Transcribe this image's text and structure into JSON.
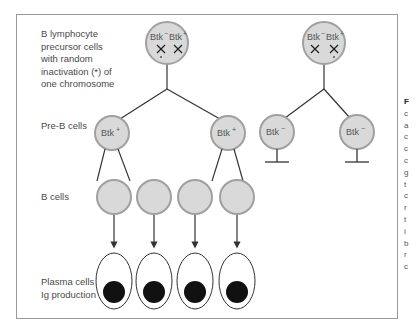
{
  "diagram": {
    "row_labels": {
      "precursor": [
        "B lymphocyte",
        "precursor cells",
        "with random",
        "inactivation (*) of",
        "one chromosome"
      ],
      "pre_b": "Pre-B cells",
      "b_cells": "B cells",
      "plasma": [
        "Plasma cells",
        "Ig production"
      ]
    },
    "left_lineage": {
      "precursor_cell": {
        "alleles": [
          "Btk",
          "Btk"
        ],
        "allele_signs": [
          "−",
          "+"
        ],
        "inactivated_allele_index": 0
      },
      "pre_b_cells": [
        {
          "label": "Btk",
          "sign": "+"
        },
        {
          "label": "Btk",
          "sign": "+"
        }
      ],
      "b_cell_count": 4,
      "plasma_cell_count": 4
    },
    "right_lineage": {
      "precursor_cell": {
        "alleles": [
          "Btk",
          "Btk"
        ],
        "allele_signs": [
          "−",
          "+"
        ],
        "inactivated_allele_index": 1
      },
      "pre_b_cells": [
        {
          "label": "Btk",
          "sign": "−"
        },
        {
          "label": "Btk",
          "sign": "−"
        }
      ],
      "outcome": "blocked"
    },
    "colors": {
      "cell_fill": "#d9d9d9",
      "cell_stroke": "#9e9e9e",
      "line": "#333333",
      "nucleus": "#111111",
      "frame": "#9a9a9a"
    },
    "inactivation_marker": "*",
    "cross_symbol": "×"
  },
  "side_text_fragments": [
    "F",
    "c",
    "a",
    "c",
    "c",
    "c",
    "g",
    "t",
    "c",
    "r",
    "t",
    "i",
    "b",
    "r",
    "c"
  ]
}
